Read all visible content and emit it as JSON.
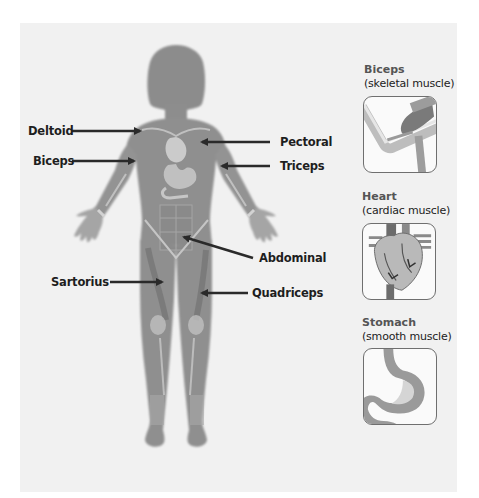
{
  "diagram": {
    "body_labels": [
      {
        "id": "deltoid",
        "text": "Deltoid"
      },
      {
        "id": "biceps",
        "text": "Biceps"
      },
      {
        "id": "pectoral",
        "text": "Pectoral"
      },
      {
        "id": "triceps",
        "text": "Triceps"
      },
      {
        "id": "abdominal",
        "text": "Abdominal"
      },
      {
        "id": "sartorius",
        "text": "Sartorius"
      },
      {
        "id": "quadriceps",
        "text": "Quadriceps"
      }
    ],
    "insets": [
      {
        "id": "biceps",
        "name": "Biceps",
        "type": "(skeletal muscle)",
        "icon": "arm-bicep-icon"
      },
      {
        "id": "heart",
        "name": "Heart",
        "type": "(cardiac muscle)",
        "icon": "heart-icon"
      },
      {
        "id": "stomach",
        "name": "Stomach",
        "type": "(smooth muscle)",
        "icon": "stomach-icon"
      }
    ]
  },
  "colors": {
    "page": "#ffffff",
    "panel": "#f1f1f1",
    "body": "#8f8f8f",
    "muscle_dark": "#7c7c7c",
    "organ_light": "#d4d4d4",
    "arrow": "#2a2a2a",
    "label": "#1e1e1e"
  }
}
